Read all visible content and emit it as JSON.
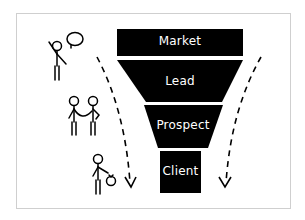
{
  "diagram": {
    "type": "sales-funnel",
    "stages": [
      {
        "label": "Market"
      },
      {
        "label": "Lead"
      },
      {
        "label": "Prospect"
      },
      {
        "label": "Client"
      }
    ],
    "illustrations": [
      {
        "name": "person-talking",
        "description": "stick figure with speech bubble"
      },
      {
        "name": "two-people-holding-hands",
        "description": "two stick figures connected"
      },
      {
        "name": "person-with-money-bag",
        "description": "stick figure holding a bag"
      }
    ],
    "arrows": [
      {
        "side": "left",
        "style": "dashed",
        "direction": "down"
      },
      {
        "side": "right",
        "style": "dashed",
        "direction": "down"
      }
    ],
    "colors": {
      "funnel": "#000000",
      "text": "#ffffff",
      "background": "#ffffff",
      "frame": "#cfcfcf"
    }
  }
}
